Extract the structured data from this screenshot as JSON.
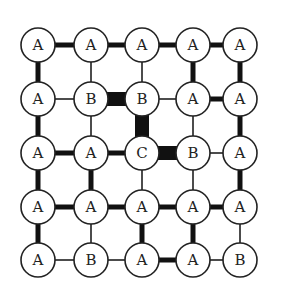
{
  "diagram": {
    "type": "lattice-grid",
    "rows": 5,
    "cols": 5,
    "col_x": [
      38,
      91,
      142,
      193,
      240
    ],
    "row_y": [
      45,
      99,
      153,
      207,
      260
    ],
    "node_radius": 17,
    "colors": {
      "stroke": "#222222",
      "fill": "#ffffff",
      "edge": "#111111"
    },
    "edge_widths": {
      "thin": 1.5,
      "thick": 5,
      "very_thick": 14
    },
    "nodes": [
      [
        "A",
        "A",
        "A",
        "A",
        "A"
      ],
      [
        "A",
        "B",
        "B",
        "A",
        "A"
      ],
      [
        "A",
        "A",
        "C",
        "B",
        "A"
      ],
      [
        "A",
        "A",
        "A",
        "A",
        "A"
      ],
      [
        "A",
        "B",
        "A",
        "A",
        "B"
      ]
    ],
    "horizontal_edges": [
      [
        "thick",
        "thick",
        "thick",
        "thick"
      ],
      [
        "thin",
        "very_thick",
        "thin",
        "thick"
      ],
      [
        "thick",
        "thick",
        "very_thick",
        "thin"
      ],
      [
        "thick",
        "thick",
        "thick",
        "thick"
      ],
      [
        "thin",
        "thin",
        "thick",
        "thin"
      ]
    ],
    "vertical_edges": [
      [
        "thick",
        "thin",
        "thin",
        "thick",
        "thick"
      ],
      [
        "thick",
        "thin",
        "very_thick",
        "thin",
        "thick"
      ],
      [
        "thick",
        "thick",
        "thin",
        "thin",
        "thick"
      ],
      [
        "thick",
        "thin",
        "thick",
        "thick",
        "thin"
      ]
    ]
  }
}
